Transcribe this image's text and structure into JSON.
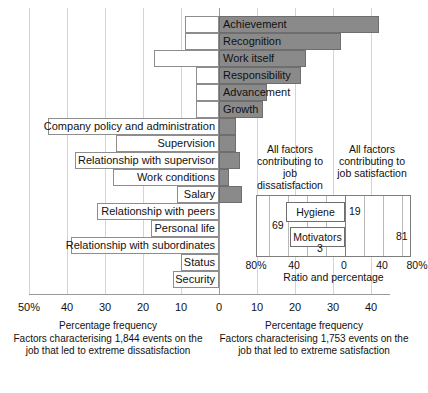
{
  "chart_data": {
    "type": "bar",
    "title": "",
    "orientation": "horizontal-diverging",
    "xlabel_left": "Percentage frequency",
    "xlabel_right": "Percentage frequency",
    "axis": {
      "left_ticks": [
        "50%",
        "40",
        "30",
        "20",
        "10",
        "0"
      ],
      "right_ticks": [
        "10",
        "20",
        "30",
        "40"
      ],
      "all_ticks": [
        "50%",
        "40",
        "30",
        "20",
        "10",
        "0",
        "10",
        "20",
        "30",
        "40"
      ],
      "xlim": [
        -50,
        45
      ],
      "grid": true
    },
    "categories": [
      "Achievement",
      "Recognition",
      "Work itself",
      "Responsibility",
      "Advancement",
      "Growth",
      "Company policy and administration",
      "Supervision",
      "Relationship with supervisor",
      "Work conditions",
      "Salary",
      "Relationship with peers",
      "Personal life",
      "Relationship with subordinates",
      "Status",
      "Security"
    ],
    "series": [
      {
        "name": "Percentage frequency (satisfaction / dissatisfaction)",
        "values": [
          42,
          32,
          23,
          21.5,
          12.5,
          11.5,
          4.5,
          4.5,
          5.5,
          2.5,
          6,
          0,
          0,
          0,
          0,
          0
        ]
      }
    ],
    "rows": [
      {
        "label": "Achievement",
        "bar": 42,
        "label_left": -9,
        "label_in_bar": true
      },
      {
        "label": "Recognition",
        "bar": 32,
        "label_left": -9,
        "label_in_bar": true
      },
      {
        "label": "Work itself",
        "bar": 23,
        "label_left": -17,
        "label_in_bar": true
      },
      {
        "label": "Responsibility",
        "bar": 21.5,
        "label_left": -6,
        "label_in_bar": true
      },
      {
        "label": "Advancement",
        "bar": 12.5,
        "label_left": -6,
        "label_in_bar": true
      },
      {
        "label": "Growth",
        "bar": 11.5,
        "label_left": -6,
        "label_in_bar": true
      },
      {
        "label": "Company policy and administration",
        "bar": 4.5,
        "label_left": -45,
        "label_in_bar": false
      },
      {
        "label": "Supervision",
        "bar": 4.5,
        "label_left": -27,
        "label_in_bar": false
      },
      {
        "label": "Relationship with supervisor",
        "bar": 5.5,
        "label_left": -38,
        "label_in_bar": false
      },
      {
        "label": "Work conditions",
        "bar": 2.5,
        "label_left": -28,
        "label_in_bar": false
      },
      {
        "label": "Salary",
        "bar": 6,
        "label_left": -11,
        "label_in_bar": false
      },
      {
        "label": "Relationship with peers",
        "bar": 0,
        "label_left": -32,
        "label_in_bar": false
      },
      {
        "label": "Personal life",
        "bar": 0,
        "label_left": -18,
        "label_in_bar": false
      },
      {
        "label": "Relationship with subordinates",
        "bar": 0,
        "label_left": -39,
        "label_in_bar": false
      },
      {
        "label": "Status",
        "bar": 0,
        "label_left": -10,
        "label_in_bar": false
      },
      {
        "label": "Security",
        "bar": 0,
        "label_left": -12,
        "label_in_bar": false
      }
    ],
    "captions": {
      "left": {
        "axis_title": "Percentage frequency",
        "description": "Factors characterising 1,844 events on the job that led to extreme dissatisfaction"
      },
      "right": {
        "axis_title": "Percentage frequency",
        "description": "Factors characterising 1,753 events on the job that led to extreme satisfaction"
      }
    },
    "inset": {
      "type": "bar",
      "heading_left": "All factors contributing to job dissatisfaction",
      "heading_right": "All factors contributing to job satisfaction",
      "axis_label": "Ratio and percentage",
      "ticks": [
        "80%",
        "40",
        "0",
        "40",
        "80%"
      ],
      "xlim": [
        -100,
        100
      ],
      "bars": [
        {
          "name": "Hygiene",
          "left": 69,
          "right": 19
        },
        {
          "name": "Motivators",
          "left": 3,
          "right": 81
        }
      ],
      "values": {
        "hygiene_left": "69",
        "hygiene_right": "19",
        "motivators_left": "3",
        "motivators_right": "81"
      }
    },
    "colors": {
      "bar_fill": "#8a8a8a",
      "bar_stroke": "#6e6e6e",
      "grid": "#d4d4d4",
      "text": "#111111",
      "panel_border": "#7d7d7d",
      "background": "#ffffff"
    }
  }
}
